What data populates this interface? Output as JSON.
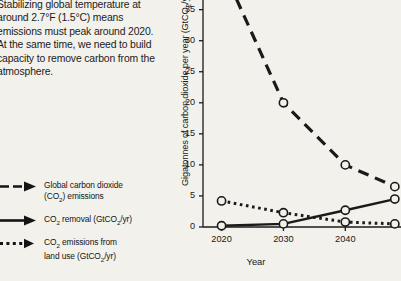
{
  "body_text": {
    "paragraph": "Stabilizing global temperature at around 2.7°F (1.5°C) means emissions must peak around 2020. At the same time, we need to build capacity to remove carbon from the atmosphere."
  },
  "legend": {
    "position": "bottom-left",
    "items": [
      {
        "id": "global-co2-emissions",
        "label_line1": "Global carbon dioxide",
        "label_line2_pre": "(CO",
        "label_line2_sub": "2",
        "label_line2_post": ") emissions",
        "style": "dashed",
        "arrow": true
      },
      {
        "id": "co2-removal",
        "label_line1_pre": "CO",
        "label_line1_sub": "2",
        "label_line1_mid": " removal (GtCO",
        "label_line1_sub2": "2",
        "label_line1_post": "/yr)",
        "style": "solid",
        "arrow": true
      },
      {
        "id": "co2-emissions-land-use",
        "label_line1_pre": "CO",
        "label_line1_sub": "2",
        "label_line1_post": " emissions from",
        "label_line2_pre": "land use (GtCO",
        "label_line2_sub": "2",
        "label_line2_post": "/yr)",
        "style": "dotted",
        "arrow": true
      }
    ]
  },
  "chart_data": {
    "type": "line",
    "title": "",
    "xlabel": "Year",
    "ylabel_pre": "Gigatonnes of carbon dioxide per year (GtCO",
    "ylabel_sub": "2",
    "ylabel_post": "/yr)",
    "ylabel": "Gigatonnes of carbon dioxide per year (GtCO2/yr)",
    "x": [
      2020,
      2030,
      2040,
      2048
    ],
    "xticks": [
      "2020",
      "2030",
      "2040"
    ],
    "xtick_values": [
      2020,
      2030,
      2040
    ],
    "yticks": [
      "0",
      "5",
      "10",
      "15",
      "20",
      "25",
      "30",
      "35"
    ],
    "ytick_values": [
      0,
      5,
      10,
      15,
      20,
      25,
      30,
      35
    ],
    "xlim": [
      2017,
      2049
    ],
    "ylim": [
      0,
      38
    ],
    "grid": false,
    "legend_position": "outside-left",
    "series": [
      {
        "name": "Global carbon dioxide (CO2) emissions",
        "style": "dashed",
        "marker": "open-circle",
        "values": [
          42,
          20,
          10,
          6.5
        ],
        "note": "2020 point lies above the visible top of the axis"
      },
      {
        "name": "CO2 removal (GtCO2/yr)",
        "style": "solid",
        "marker": "open-circle",
        "values": [
          0.2,
          0.5,
          2.7,
          4.5
        ]
      },
      {
        "name": "CO2 emissions from land use (GtCO2/yr)",
        "style": "dotted",
        "marker": "open-circle",
        "values": [
          4.2,
          2.3,
          0.8,
          0.5
        ]
      }
    ]
  },
  "colors": {
    "background": "#f2f1ec",
    "ink": "#1a1a1a",
    "axis": "#1a1a1a",
    "marker_fill": "#f2f1ec"
  }
}
